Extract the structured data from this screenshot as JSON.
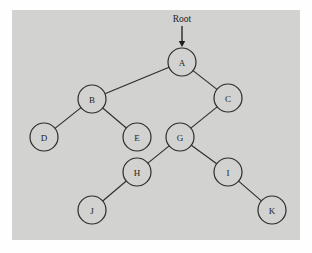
{
  "figure": {
    "type": "tree-diagram",
    "background_color": "#fefefe",
    "panel_color": "#d2d2d0",
    "ink_color": "#1d1d1d",
    "annotation": {
      "label": "Root",
      "label_x": 182,
      "label_y": 22,
      "arrow_from_x": 182,
      "arrow_from_y": 26,
      "arrow_to_x": 182,
      "arrow_to_y": 47,
      "points_to": "A"
    },
    "node_radius": 14,
    "nodes": [
      {
        "id": "A",
        "label": "A",
        "x": 182,
        "y": 62
      },
      {
        "id": "B",
        "label": "B",
        "x": 92,
        "y": 99
      },
      {
        "id": "C",
        "label": "C",
        "x": 228,
        "y": 98
      },
      {
        "id": "D",
        "label": "D",
        "x": 44,
        "y": 137
      },
      {
        "id": "E",
        "label": "E",
        "x": 137,
        "y": 137
      },
      {
        "id": "G",
        "label": "G",
        "x": 180,
        "y": 137
      },
      {
        "id": "H",
        "label": "H",
        "x": 137,
        "y": 172
      },
      {
        "id": "I",
        "label": "I",
        "x": 228,
        "y": 172
      },
      {
        "id": "J",
        "label": "J",
        "x": 92,
        "y": 210
      },
      {
        "id": "K",
        "label": "K",
        "x": 272,
        "y": 210
      }
    ],
    "edges": [
      {
        "from": "A",
        "to": "B"
      },
      {
        "from": "A",
        "to": "C"
      },
      {
        "from": "B",
        "to": "D"
      },
      {
        "from": "B",
        "to": "E"
      },
      {
        "from": "C",
        "to": "G"
      },
      {
        "from": "G",
        "to": "H"
      },
      {
        "from": "G",
        "to": "I"
      },
      {
        "from": "H",
        "to": "J"
      },
      {
        "from": "I",
        "to": "K"
      }
    ]
  }
}
